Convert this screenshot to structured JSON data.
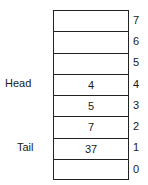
{
  "diagram": {
    "type": "array-queue",
    "slots": [
      {
        "index": "7",
        "value": ""
      },
      {
        "index": "6",
        "value": ""
      },
      {
        "index": "5",
        "value": ""
      },
      {
        "index": "4",
        "value": "4"
      },
      {
        "index": "3",
        "value": "5"
      },
      {
        "index": "2",
        "value": "7"
      },
      {
        "index": "1",
        "value": "37"
      },
      {
        "index": "0",
        "value": ""
      }
    ],
    "pointers": {
      "head": {
        "label": "Head",
        "index": "4"
      },
      "tail": {
        "label": "Tail",
        "index": "1"
      }
    }
  }
}
